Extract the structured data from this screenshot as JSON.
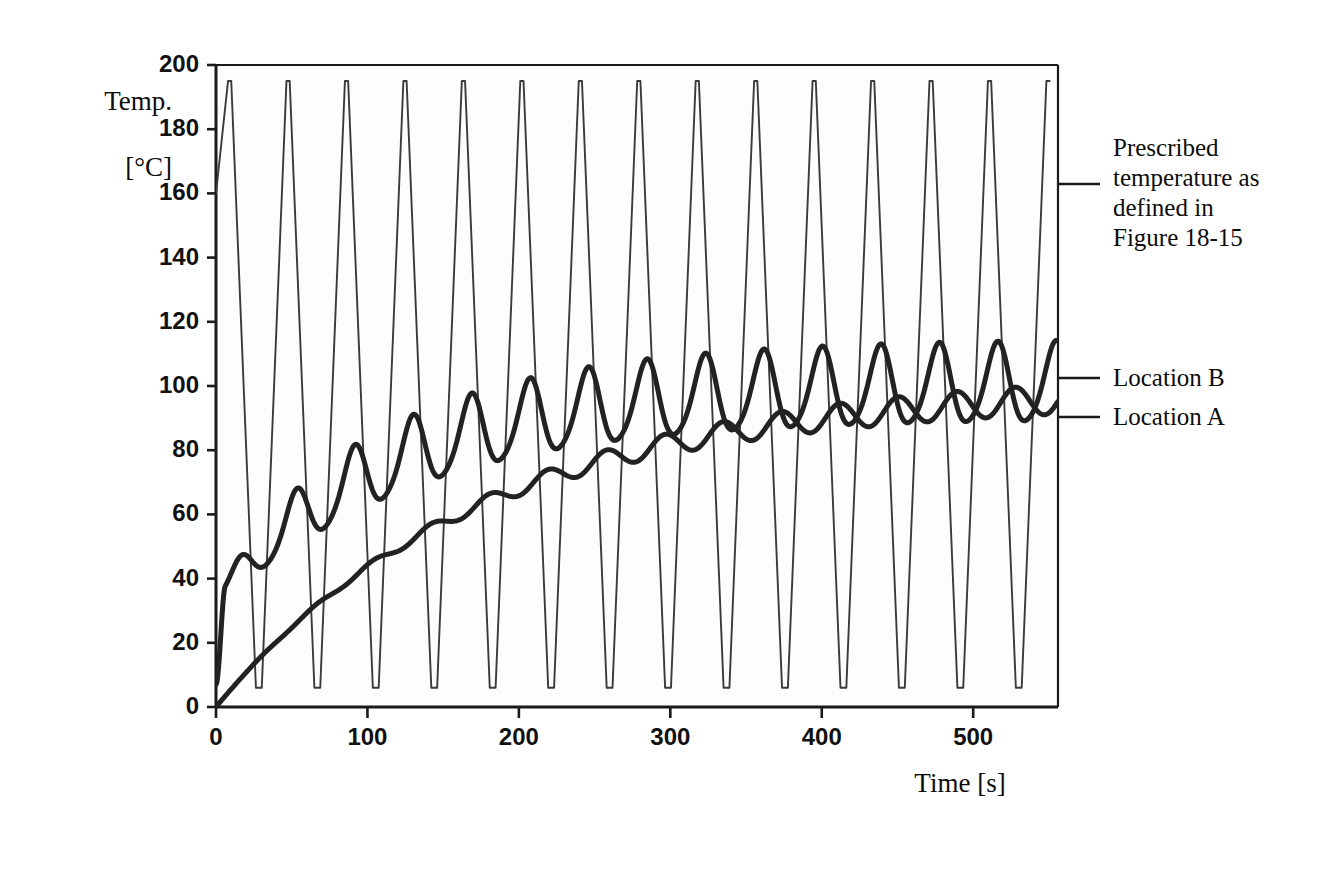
{
  "figure": {
    "ylabel_line1": "Temp.",
    "ylabel_line2": "[°C]",
    "xlabel": "Time [s]",
    "background_color": "#ffffff",
    "plot_background_color": "#fdfdfd",
    "axis_color": "#1a1a1a",
    "thin_curve_color": "#3a3a3a",
    "thick_curve_color": "#222222"
  },
  "annotations": [
    {
      "name": "prescribed-temperature",
      "lines": [
        "Prescribed",
        "temperature as",
        "defined in",
        "Figure 18-15"
      ],
      "leader_y": 184,
      "text_x": 1113,
      "text_y": 133
    },
    {
      "name": "location-b",
      "lines": [
        "Location B"
      ],
      "leader_y": 378,
      "text_x": 1113,
      "text_y": 363
    },
    {
      "name": "location-a",
      "lines": [
        "Location A"
      ],
      "leader_y": 417,
      "text_x": 1113,
      "text_y": 402
    }
  ],
  "chart_data": {
    "type": "line",
    "title": "",
    "xlabel": "Time [s]",
    "ylabel": "Temp. [°C]",
    "xlim": [
      0,
      556
    ],
    "ylim": [
      0,
      200
    ],
    "xticks": [
      0,
      100,
      200,
      300,
      400,
      500
    ],
    "yticks": [
      0,
      20,
      40,
      60,
      80,
      100,
      120,
      140,
      160,
      180,
      200
    ],
    "xtick_labels": [
      "0",
      "100",
      "200",
      "300",
      "400",
      "500"
    ],
    "ytick_labels": [
      "0",
      "20",
      "40",
      "60",
      "80",
      "100",
      "120",
      "140",
      "160",
      "180",
      "200"
    ],
    "grid": false,
    "legend": "leader-lines-right",
    "series": [
      {
        "name": "Prescribed temperature as defined in Figure 18-15",
        "style": "thin",
        "color": "#3a3a3a",
        "width": 1.9,
        "waveform": "trapezoid",
        "peak_value": 195,
        "trough_value": 6,
        "period": 38.6,
        "first_peak_time": 9.0,
        "peak_flat_fraction": 0.055,
        "trough_flat_fraction": 0.1,
        "start_value": 160,
        "description": "Sharp trapezoidal thermal cycle oscillating between 6 C and 195 C with a period of about 38.6 s; 14 peaks across the record."
      },
      {
        "name": "Location B",
        "style": "thick",
        "color": "#222222",
        "width": 5.0,
        "waveform": "damped-oscillation-on-rising-mean",
        "period": 38.6,
        "first_peak_time": 14.0,
        "start_value": 7,
        "mean_start": 34,
        "mean_final": 101,
        "mean_time_constant": 118,
        "amplitude_start": 9,
        "amplitude_final": 13,
        "peaks": [
          46,
          54,
          64,
          73,
          83,
          93,
          97,
          104,
          108,
          110,
          111,
          112,
          113,
          113,
          114,
          114,
          115,
          115
        ],
        "troughs": [
          34,
          46,
          55,
          63,
          70,
          77,
          83,
          85,
          88,
          89,
          90,
          90,
          91,
          91,
          91,
          91,
          91
        ],
        "description": "Surface location: oscillates strongly in phase with the prescribed cycle, mean temperature rising from about 34 C to a steady 101 C with peak-to-peak swing near 25 C."
      },
      {
        "name": "Location A",
        "style": "thick",
        "color": "#222222",
        "width": 5.0,
        "waveform": "smooth-rising-with-small-ripple",
        "period": 38.6,
        "start_value": 0,
        "mean_final": 100,
        "mean_time_constant": 175,
        "amplitude_start": 0,
        "amplitude_final": 5,
        "description": "Interior location: smooth monotonic rise from 0 C, asymptoting near 100 C, with a small lagging ripple of about +/- 5 C once warmed."
      }
    ]
  },
  "plot_geometry": {
    "left": 216,
    "right": 1058,
    "top": 65,
    "bottom": 707
  }
}
